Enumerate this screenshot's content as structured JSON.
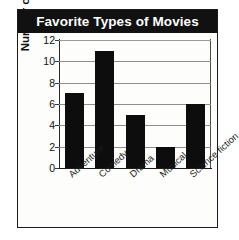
{
  "chart_data": {
    "type": "bar",
    "title": "Favorite Types of Movies",
    "xlabel": "",
    "ylabel": "Number of students",
    "categories": [
      "Adventure",
      "Comedy",
      "Drama",
      "Musical",
      "Science fiction"
    ],
    "values": [
      7,
      11,
      5,
      2,
      6
    ],
    "ylim": [
      0,
      12
    ],
    "ytick_labels": [
      "0",
      "2",
      "4",
      "6",
      "8",
      "10",
      "12"
    ],
    "ytick_values": [
      0,
      2,
      4,
      6,
      8,
      10,
      12
    ],
    "grid": true,
    "legend": false,
    "bar_color": "#0d0d0d",
    "title_background": "#111111",
    "title_color": "#ffffff",
    "gridline_color": "#8d8d8d",
    "axis_color": "#1b1b1b",
    "plot_background": "#fdfdfc"
  }
}
